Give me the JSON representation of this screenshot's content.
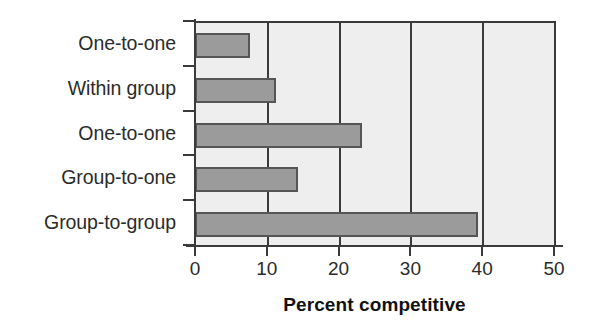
{
  "chart_data": {
    "type": "bar",
    "orientation": "horizontal",
    "title": "",
    "subtitle": "",
    "xlabel": "Percent competitive",
    "ylabel": "",
    "xlim": [
      0,
      50
    ],
    "xticks": [
      0,
      10,
      20,
      30,
      40,
      50
    ],
    "xtick_labels": [
      "0",
      "10",
      "20",
      "30",
      "40",
      "50"
    ],
    "grid": "vertical",
    "legend": "none",
    "categories": [
      "One-to-one",
      "Within group",
      "One-to-one",
      "Group-to-one",
      "Group-to-group"
    ],
    "values": [
      7.7,
      11.3,
      23.3,
      14.3,
      39.4
    ],
    "series": [
      {
        "name": "Percent competitive",
        "values": [
          7.7,
          11.3,
          23.3,
          14.3,
          39.4
        ]
      }
    ],
    "colors": {
      "bar_fill": "#9b9b9b",
      "bar_border": "#555555",
      "plot_background": "#eeeeee",
      "axis": "#3a3a3a",
      "text": "#2b2b2b",
      "figure_background": "#ffffff"
    }
  }
}
